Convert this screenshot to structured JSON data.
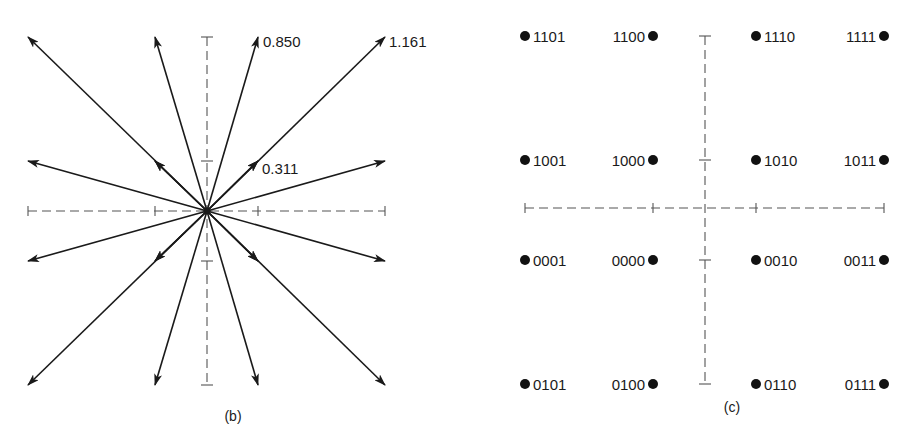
{
  "figure_b": {
    "caption": "(b)",
    "amplitude_labels": [
      {
        "text": "0.850",
        "points_to": [
          1,
          3
        ]
      },
      {
        "text": "1.161",
        "points_to": [
          3,
          3
        ]
      },
      {
        "text": "0.311",
        "points_to": [
          1,
          1
        ]
      }
    ],
    "vectors": [
      [
        -3,
        3
      ],
      [
        -1,
        3
      ],
      [
        1,
        3
      ],
      [
        3,
        3
      ],
      [
        -3,
        1
      ],
      [
        -1,
        1
      ],
      [
        1,
        1
      ],
      [
        3,
        1
      ],
      [
        -3,
        -1
      ],
      [
        -1,
        -1
      ],
      [
        1,
        -1
      ],
      [
        3,
        -1
      ],
      [
        -3,
        -3
      ],
      [
        -1,
        -3
      ],
      [
        1,
        -3
      ],
      [
        3,
        -3
      ]
    ]
  },
  "figure_c": {
    "caption": "(c)",
    "points": [
      {
        "i": -3,
        "q": 3,
        "code": "1101",
        "label_side": "right"
      },
      {
        "i": -1,
        "q": 3,
        "code": "1100",
        "label_side": "left"
      },
      {
        "i": 1,
        "q": 3,
        "code": "1110",
        "label_side": "right"
      },
      {
        "i": 3,
        "q": 3,
        "code": "1111",
        "label_side": "left"
      },
      {
        "i": -3,
        "q": 1,
        "code": "1001",
        "label_side": "right"
      },
      {
        "i": -1,
        "q": 1,
        "code": "1000",
        "label_side": "left"
      },
      {
        "i": 1,
        "q": 1,
        "code": "1010",
        "label_side": "right"
      },
      {
        "i": 3,
        "q": 1,
        "code": "1011",
        "label_side": "left"
      },
      {
        "i": -3,
        "q": -1,
        "code": "0001",
        "label_side": "right"
      },
      {
        "i": -1,
        "q": -1,
        "code": "0000",
        "label_side": "left"
      },
      {
        "i": 1,
        "q": -1,
        "code": "0010",
        "label_side": "right"
      },
      {
        "i": 3,
        "q": -1,
        "code": "0011",
        "label_side": "left"
      },
      {
        "i": -3,
        "q": -3,
        "code": "0101",
        "label_side": "right"
      },
      {
        "i": -1,
        "q": -3,
        "code": "0100",
        "label_side": "left"
      },
      {
        "i": 1,
        "q": -3,
        "code": "0110",
        "label_side": "right"
      },
      {
        "i": 3,
        "q": -3,
        "code": "0111",
        "label_side": "left"
      }
    ]
  },
  "chart_data": [
    {
      "type": "scatter",
      "title": "(b) 16-QAM signal vectors",
      "xlabel": "",
      "ylabel": "",
      "xlim": [
        -3,
        3
      ],
      "ylim": [
        -3,
        3
      ],
      "grid": false,
      "annotations": [
        "0.850",
        "1.161",
        "0.311"
      ],
      "x": [
        -3,
        -1,
        1,
        3,
        -3,
        -1,
        1,
        3,
        -3,
        -1,
        1,
        3,
        -3,
        -1,
        1,
        3
      ],
      "y": [
        3,
        3,
        3,
        3,
        1,
        1,
        1,
        1,
        -1,
        -1,
        -1,
        -1,
        -3,
        -3,
        -3,
        -3
      ]
    },
    {
      "type": "scatter",
      "title": "(c) 16-QAM constellation with Gray-coded labels",
      "xlabel": "",
      "ylabel": "",
      "xlim": [
        -3,
        3
      ],
      "ylim": [
        -3,
        3
      ],
      "grid": false,
      "x": [
        -3,
        -1,
        1,
        3,
        -3,
        -1,
        1,
        3,
        -3,
        -1,
        1,
        3,
        -3,
        -1,
        1,
        3
      ],
      "y": [
        3,
        3,
        3,
        3,
        1,
        1,
        1,
        1,
        -1,
        -1,
        -1,
        -1,
        -3,
        -3,
        -3,
        -3
      ],
      "point_labels": [
        "1101",
        "1100",
        "1110",
        "1111",
        "1001",
        "1000",
        "1010",
        "1011",
        "0001",
        "0000",
        "0010",
        "0011",
        "0101",
        "0100",
        "0110",
        "0111"
      ]
    }
  ]
}
